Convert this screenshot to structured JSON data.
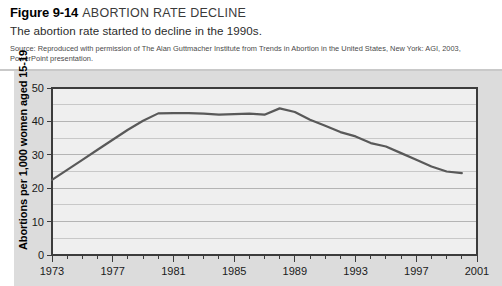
{
  "figure": {
    "number": "Figure 9-14",
    "title": "ABORTION RATE DECLINE",
    "subtitle": "The abortion rate started to decline in the 1990s.",
    "source": "Source: Reproduced with permission of The Alan Guttmacher Institute from Trends in Abortion in the United States, New York: AGI, 2003, PowerPoint presentation."
  },
  "chart_data": {
    "type": "line",
    "title": "ABORTION RATE DECLINE",
    "xlabel": "",
    "ylabel": "Abortions per 1,000 women aged 15-19",
    "xlim": [
      1973,
      2001
    ],
    "ylim": [
      0,
      50
    ],
    "yticks": [
      0,
      10,
      20,
      30,
      40,
      50
    ],
    "ytick_labels": [
      "0",
      "10",
      "20",
      "30",
      "40",
      "50"
    ],
    "xticks": [
      1973,
      1977,
      1981,
      1985,
      1989,
      1993,
      1997,
      2001
    ],
    "xtick_labels": [
      "1973",
      "1977",
      "1981",
      "1985",
      "1989",
      "1993",
      "1997",
      "2001"
    ],
    "minor_xticks_every": 1,
    "grid": "horizontal-minor-every-5",
    "legend": "none",
    "line_color": "#595959",
    "plot_bg": "#efefef",
    "x": [
      1973,
      1974,
      1975,
      1976,
      1977,
      1978,
      1979,
      1980,
      1981,
      1982,
      1983,
      1984,
      1985,
      1986,
      1987,
      1988,
      1989,
      1990,
      1991,
      1992,
      1993,
      1994,
      1995,
      1996,
      1997,
      1998,
      1999,
      2000
    ],
    "values": [
      22.5,
      25.5,
      28.5,
      31.5,
      34.5,
      37.5,
      40.2,
      42.4,
      42.5,
      42.5,
      42.3,
      42.0,
      42.2,
      42.3,
      42.0,
      43.9,
      42.8,
      40.5,
      38.7,
      36.8,
      35.5,
      33.5,
      32.5,
      30.5,
      28.5,
      26.5,
      25.0,
      24.5
    ]
  }
}
